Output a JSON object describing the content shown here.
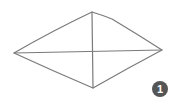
{
  "diagram": {
    "shape": "rhombus",
    "stroke_color": "#7a7a7a",
    "vertices": {
      "left": [
        14,
        53
      ],
      "top": [
        92,
        12
      ],
      "right": [
        162,
        50
      ],
      "bottom": [
        93,
        88
      ]
    },
    "diagonals": [
      "left-right",
      "top-bottom"
    ]
  },
  "badge": {
    "label": "1",
    "color": "#555555",
    "center": [
      160,
      89
    ]
  }
}
